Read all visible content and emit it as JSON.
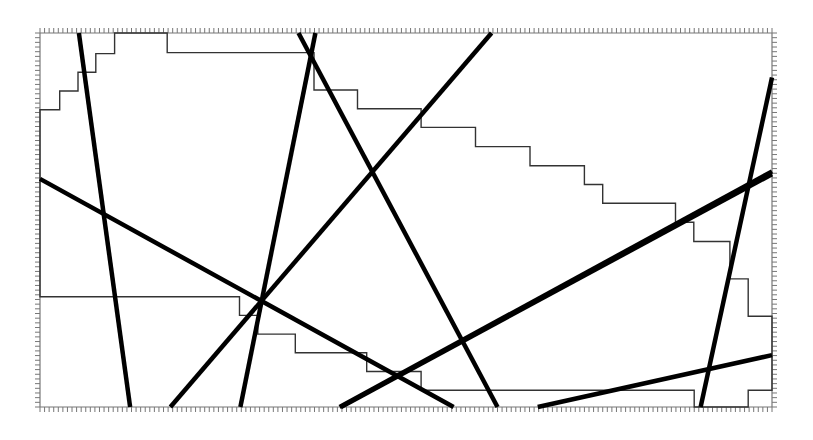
{
  "diagram": {
    "type": "line-arrangement-with-staircase-polygon",
    "domain": {
      "x": [
        0,
        160
      ],
      "y": [
        0,
        80
      ]
    },
    "tick_spacing": 1,
    "colors": {
      "lines": "#000000",
      "staircase": "#333333",
      "ticks": "#777777",
      "background": "#ffffff"
    },
    "thick_lines": [
      {
        "id": "L1",
        "from": [
          8.5,
          0
        ],
        "to": [
          19.7,
          80
        ]
      },
      {
        "id": "L2",
        "from": [
          0,
          31.2
        ],
        "to": [
          90.4,
          80
        ]
      },
      {
        "id": "L3",
        "from": [
          28.5,
          80
        ],
        "to": [
          98.7,
          0
        ]
      },
      {
        "id": "L4",
        "from": [
          43.8,
          80
        ],
        "to": [
          60.2,
          0
        ]
      },
      {
        "id": "L5",
        "from": [
          56.5,
          0
        ],
        "to": [
          100,
          80
        ]
      },
      {
        "id": "L6",
        "from": [
          65.8,
          80
        ],
        "to": [
          160,
          30.2
        ]
      },
      {
        "id": "L7",
        "from": [
          65.5,
          80
        ],
        "to": [
          160,
          29.6
        ]
      },
      {
        "id": "L8",
        "from": [
          108.8,
          80
        ],
        "to": [
          160,
          68.9
        ]
      },
      {
        "id": "L9",
        "from": [
          144.4,
          80
        ],
        "to": [
          160,
          9.5
        ]
      }
    ],
    "staircase": [
      [
        0,
        16.4
      ],
      [
        4.3,
        16.4
      ],
      [
        4.3,
        12.4
      ],
      [
        8.3,
        12.4
      ],
      [
        8.3,
        8.4
      ],
      [
        12.2,
        8.4
      ],
      [
        12.2,
        4.4
      ],
      [
        16.3,
        4.4
      ],
      [
        16.3,
        0
      ],
      [
        27.8,
        0
      ],
      [
        27.8,
        4.2
      ],
      [
        59.9,
        4.2
      ],
      [
        59.9,
        12.2
      ],
      [
        69.4,
        12.2
      ],
      [
        69.4,
        16.2
      ],
      [
        83.3,
        16.2
      ],
      [
        83.3,
        20.2
      ],
      [
        95.2,
        20.2
      ],
      [
        95.2,
        24.3
      ],
      [
        107.1,
        24.3
      ],
      [
        107.1,
        28.4
      ],
      [
        119.0,
        28.4
      ],
      [
        119.0,
        32.4
      ],
      [
        123.0,
        32.4
      ],
      [
        123.0,
        36.4
      ],
      [
        138.9,
        36.4
      ],
      [
        138.9,
        40.5
      ],
      [
        142.9,
        40.5
      ],
      [
        142.9,
        44.6
      ],
      [
        150.8,
        44.6
      ],
      [
        150.8,
        52.6
      ],
      [
        154.8,
        52.6
      ],
      [
        154.8,
        60.6
      ],
      [
        160,
        60.6
      ],
      [
        160,
        76.4
      ],
      [
        154.8,
        76.4
      ],
      [
        154.8,
        80
      ],
      [
        143.0,
        80
      ],
      [
        143.0,
        76.4
      ],
      [
        83.3,
        76.4
      ],
      [
        83.3,
        72.4
      ],
      [
        71.4,
        72.4
      ],
      [
        71.4,
        68.4
      ],
      [
        55.8,
        68.4
      ],
      [
        55.8,
        64.4
      ],
      [
        47.6,
        64.4
      ],
      [
        47.6,
        60.4
      ],
      [
        43.6,
        60.4
      ],
      [
        43.6,
        56.4
      ],
      [
        0,
        56.4
      ]
    ]
  }
}
